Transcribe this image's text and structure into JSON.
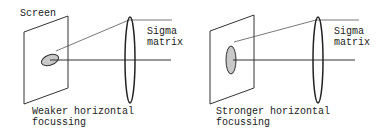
{
  "panels": [
    {
      "screen_label": "Screen",
      "lens_label_line1": "Sigma",
      "lens_label_line2": "matrix",
      "caption_line1": "Weaker horizontal",
      "caption_line2": "focussing",
      "spot_shape": "horizontal-ellipse"
    },
    {
      "screen_label": "",
      "lens_label_line1": "Sigma",
      "lens_label_line2": "matrix",
      "caption_line1": "Stronger horizontal",
      "caption_line2": "focussing",
      "spot_shape": "vertical-ellipse"
    }
  ],
  "colors": {
    "line": "#333333",
    "spot_fill": "#c8c8c8"
  }
}
